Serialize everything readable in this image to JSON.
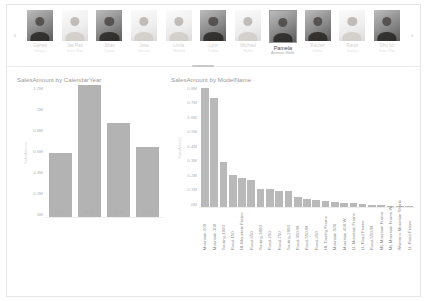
{
  "carousel": {
    "prev_label": "‹",
    "next_label": "›",
    "people": [
      {
        "name": "Garrett",
        "title": "Vargas",
        "selected": false,
        "tone": "dark"
      },
      {
        "name": "Jae Pak",
        "title": "Sales Rep",
        "selected": false,
        "tone": "light"
      },
      {
        "name": "Jillian",
        "title": "Carson",
        "selected": false,
        "tone": "dark"
      },
      {
        "name": "Jose",
        "title": "Saraiva",
        "selected": false,
        "tone": "light"
      },
      {
        "name": "Linda",
        "title": "Mitchell",
        "selected": false,
        "tone": "light"
      },
      {
        "name": "Lynn",
        "title": "Tsoflias",
        "selected": false,
        "tone": "dark"
      },
      {
        "name": "Michael",
        "title": "Blythe",
        "selected": false,
        "tone": "light"
      },
      {
        "name": "Pamela",
        "title": "Ansman-Wolfe",
        "selected": true,
        "tone": "dark"
      },
      {
        "name": "Rachel",
        "title": "Valdez",
        "selected": false,
        "tone": "dark"
      },
      {
        "name": "Ranjit",
        "title": "Varkey",
        "selected": false,
        "tone": "light"
      },
      {
        "name": "Shu Ito",
        "title": "Sales Rep",
        "selected": false,
        "tone": "dark"
      }
    ]
  },
  "chart_data": [
    {
      "id": "left",
      "type": "bar",
      "title": "SalesAmount by CalendarYear",
      "xlabel": "",
      "ylabel": "SalesAmount",
      "categories": [
        "2005",
        "2006",
        "2007",
        "2008"
      ],
      "values": [
        600000,
        1230000,
        870000,
        650000
      ],
      "ylim": [
        0,
        1200000
      ],
      "yticks": [
        "1.2M",
        "1M",
        "0.8M",
        "0.6M",
        "0.4M",
        "0.2M",
        "0M"
      ],
      "grid": false,
      "legend": "none"
    },
    {
      "id": "right",
      "type": "bar",
      "title": "SalesAmount by ModelName",
      "xlabel": "",
      "ylabel": "SalesAmount",
      "categories": [
        "Mountain-200",
        "Mountain-100",
        "Touring-1000",
        "Road-150",
        "HL Mountain Frame",
        "Road-650",
        "Touring-3000",
        "Road-250",
        "Road-750",
        "Touring-2000",
        "Road-350-W",
        "Road-550-W",
        "Road-450",
        "HL Touring Frame",
        "Mountain-500",
        "Mountain-400-W",
        "LL Mountain Frame",
        "LL Road Frame",
        "Road-550-W",
        "ML Mountain Frame",
        "ML Mountain Frame-W",
        "Women's Mountain Shorts",
        "LL Road Frame"
      ],
      "values": [
        800000,
        735000,
        300000,
        215000,
        195000,
        180000,
        120000,
        118000,
        110000,
        108000,
        70000,
        52000,
        44000,
        40000,
        32000,
        28000,
        24000,
        20000,
        16000,
        12000,
        9000,
        7000,
        5000
      ],
      "ylim": [
        0,
        800000
      ],
      "yticks": [
        "0.8M",
        "0.7M",
        "0.6M",
        "0.5M",
        "0.4M",
        "0.3M",
        "0.2M",
        "0.1M",
        "0M"
      ],
      "grid": false,
      "legend": "none"
    }
  ]
}
